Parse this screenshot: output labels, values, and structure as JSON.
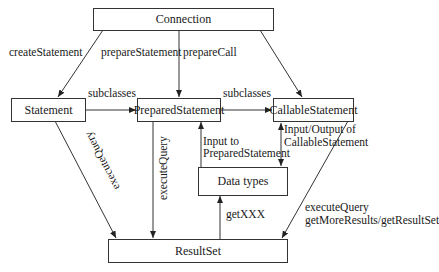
{
  "nodes": {
    "connection": "Connection",
    "statement": "Statement",
    "prepared_statement": "PreparedStatement",
    "callable_statement": "CallableStatement",
    "data_types": "Data types",
    "result_set": "ResultSet"
  },
  "edges": {
    "create_statement": "createStatement",
    "prepare_statement": "prepareStatement",
    "prepare_call": "prepareCall",
    "subclasses_1": "subclasses",
    "subclasses_2": "subclasses",
    "stmt_execute_query": "executeQuery",
    "ps_execute_query": "executeQuery",
    "input_to_ps_line1": "Input to",
    "input_to_ps_line2": "PreparedStatement",
    "io_cs_line1": "Input/Output of",
    "io_cs_line2": "CallableStatement",
    "get_xxx": "getXXX",
    "cs_results_line1": "executeQuery",
    "cs_results_line2": "getMoreResults/getResultSet"
  }
}
